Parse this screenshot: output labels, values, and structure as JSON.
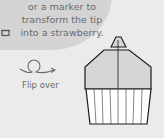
{
  "instruction": {
    "lines": [
      "or a marker to",
      "transform the tip",
      "into a strawberry."
    ]
  },
  "step": {
    "flip_label": "Flip over",
    "flip_icon": "flip-over-loop-arrow-icon",
    "marker_icon": "marker-icon"
  },
  "colors": {
    "background": "#ebebeb",
    "bubble": "#d4d4d4",
    "text": "#6b6b6b",
    "shape_top_fill": "#d6d6d6",
    "shape_bottom_fill": "#ffffff",
    "outline": "#1a1a1a"
  }
}
